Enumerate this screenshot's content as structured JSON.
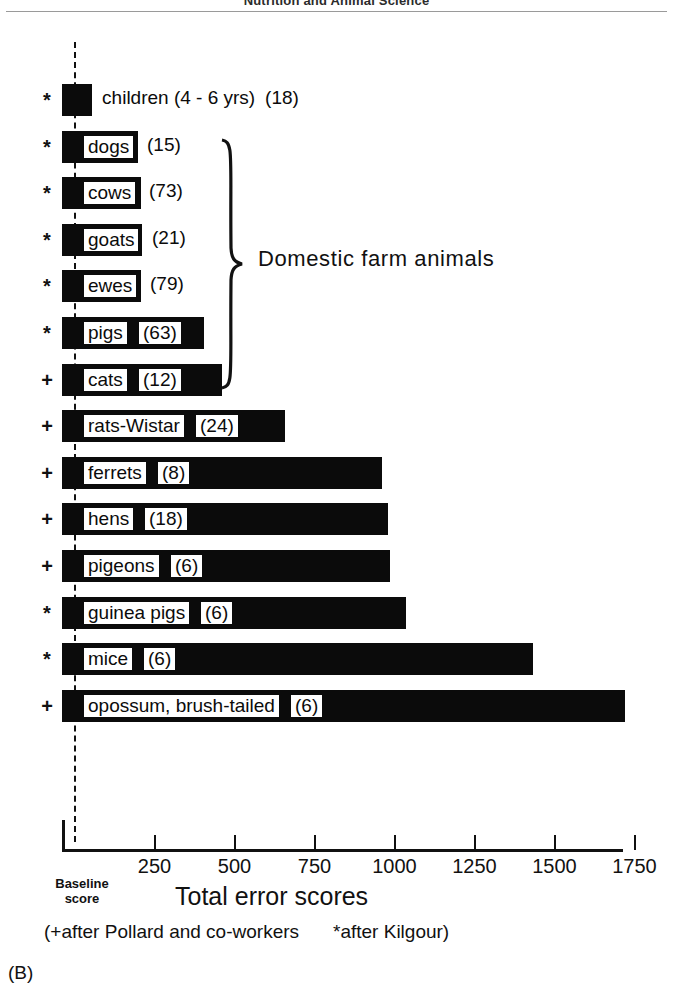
{
  "page": {
    "running_head": "Nutrition and Animal Science",
    "panel_letter": "(B)"
  },
  "chart_data": {
    "type": "bar",
    "orientation": "horizontal",
    "title": "",
    "xlabel": "Total error scores",
    "ylabel": "",
    "xlim": [
      0,
      1800
    ],
    "grid": false,
    "legend_position": "below-axis",
    "baseline_label_line1": "Baseline",
    "baseline_label_line2": "score",
    "tick_values": [
      250,
      500,
      750,
      1000,
      1250,
      1500,
      1750
    ],
    "tick_labels": [
      "250",
      "500",
      "750",
      "1000",
      "1250",
      "1500",
      "1750"
    ],
    "categories": [
      "children (4 - 6 yrs)",
      "dogs",
      "cows",
      "goats",
      "ewes",
      "pigs",
      "cats",
      "rats-Wistar",
      "ferrets",
      "hens",
      "pigeons",
      "guinea pigs",
      "mice",
      "opossum, brush-tailed"
    ],
    "values": [
      55,
      198,
      208,
      211,
      208,
      405,
      461,
      658,
      961,
      980,
      987,
      1035,
      1433,
      1720
    ],
    "sample_sizes": [
      18,
      15,
      73,
      21,
      79,
      63,
      12,
      24,
      8,
      18,
      6,
      6,
      6,
      6
    ],
    "source_markers": [
      "*",
      "*",
      "*",
      "*",
      "*",
      "*",
      "+",
      "+",
      "+",
      "+",
      "+",
      "*",
      "*",
      "+"
    ],
    "annotations": [
      {
        "text": "Domestic farm animals",
        "covers": [
          "dogs",
          "cows",
          "goats",
          "ewes",
          "pigs"
        ]
      }
    ],
    "footnote_left": "(+after Pollard and co-workers",
    "footnote_right": "*after Kilgour)"
  },
  "rows": [
    {
      "marker": "*",
      "label": "children (4 - 6 yrs)",
      "count": "(18)",
      "value": 55,
      "label_outside": true,
      "count_outside": true
    },
    {
      "marker": "*",
      "label": "dogs",
      "count": "(15)",
      "value": 198,
      "label_outside": false,
      "count_outside": true
    },
    {
      "marker": "*",
      "label": "cows",
      "count": "(73)",
      "value": 208,
      "label_outside": false,
      "count_outside": true
    },
    {
      "marker": "*",
      "label": "goats",
      "count": "(21)",
      "value": 211,
      "label_outside": false,
      "count_outside": true
    },
    {
      "marker": "*",
      "label": "ewes",
      "count": "(79)",
      "value": 208,
      "label_outside": false,
      "count_outside": true
    },
    {
      "marker": "*",
      "label": "pigs",
      "count": "(63)",
      "value": 405,
      "label_outside": false,
      "count_outside": false
    },
    {
      "marker": "+",
      "label": "cats",
      "count": "(12)",
      "value": 461,
      "label_outside": false,
      "count_outside": false
    },
    {
      "marker": "+",
      "label": "rats-Wistar",
      "count": "(24)",
      "value": 658,
      "label_outside": false,
      "count_outside": false
    },
    {
      "marker": "+",
      "label": "ferrets",
      "count": "(8)",
      "value": 961,
      "label_outside": false,
      "count_outside": false
    },
    {
      "marker": "+",
      "label": "hens",
      "count": "(18)",
      "value": 980,
      "label_outside": false,
      "count_outside": false
    },
    {
      "marker": "+",
      "label": "pigeons",
      "count": "(6)",
      "value": 987,
      "label_outside": false,
      "count_outside": false
    },
    {
      "marker": "*",
      "label": "guinea pigs",
      "count": "(6)",
      "value": 1035,
      "label_outside": false,
      "count_outside": false
    },
    {
      "marker": "*",
      "label": "mice",
      "count": "(6)",
      "value": 1433,
      "label_outside": false,
      "count_outside": false
    },
    {
      "marker": "+",
      "label": "opossum, brush-tailed",
      "count": "(6)",
      "value": 1720,
      "label_outside": false,
      "count_outside": false
    }
  ]
}
